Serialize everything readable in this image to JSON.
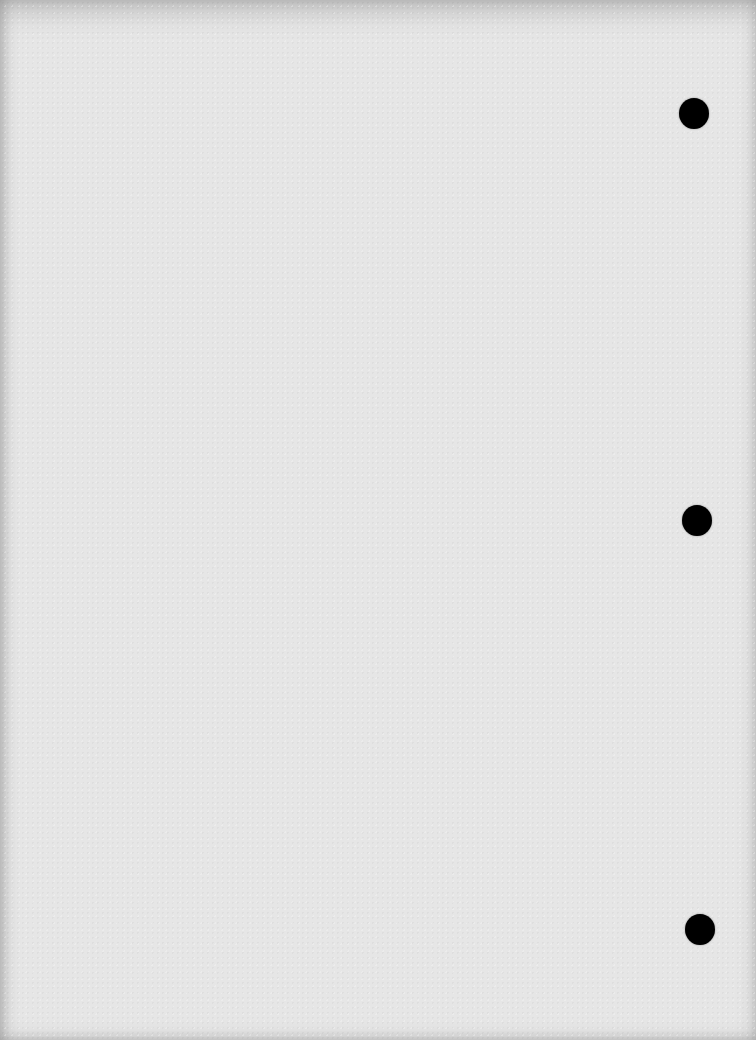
{
  "document": {
    "type": "blank scanned page",
    "background_color": "#e6e6e6",
    "punch_holes": [
      {
        "cx": 694,
        "cy": 113
      },
      {
        "cx": 697,
        "cy": 520
      },
      {
        "cx": 700,
        "cy": 929
      }
    ],
    "hole_color": "#000000"
  }
}
